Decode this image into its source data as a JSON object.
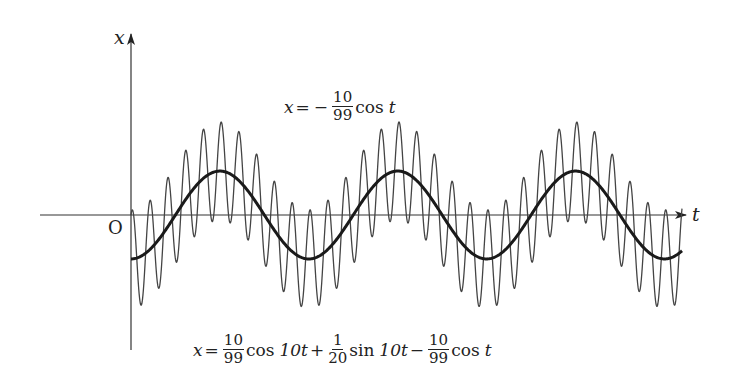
{
  "diagram": {
    "axes": {
      "horizontal_label": "t",
      "vertical_label": "x",
      "origin_label": "O"
    },
    "curves": [
      {
        "name": "slow-component",
        "style": "thick",
        "formula": "x = -(10/99) cos t"
      },
      {
        "name": "full-solution",
        "style": "thin",
        "formula": "x = (10/99) cos 10t + (1/20) sin 10t - (10/99) cos t"
      }
    ],
    "t_range": [
      0,
      19.47
    ],
    "periods_shown_slow": 3.1,
    "colors": {
      "axis": "#333333",
      "thick_curve": "#1a1a1a",
      "thin_curve": "#444444"
    },
    "labels": {
      "top_eq": {
        "lhs": "x",
        "eq": "=",
        "minus": "−",
        "frac_num": "10",
        "frac_den": "99",
        "func": "cos",
        "var": "t"
      },
      "bottom_eq": {
        "lhs": "x",
        "eq": "=",
        "f1_num": "10",
        "f1_den": "99",
        "func1": "cos",
        "arg1": "10t",
        "plus": "+",
        "f2_num": "1",
        "f2_den": "20",
        "func2": "sin",
        "arg2": "10t",
        "minus": "−",
        "f3_num": "10",
        "f3_den": "99",
        "func3": "cos",
        "arg3": "t"
      }
    }
  }
}
